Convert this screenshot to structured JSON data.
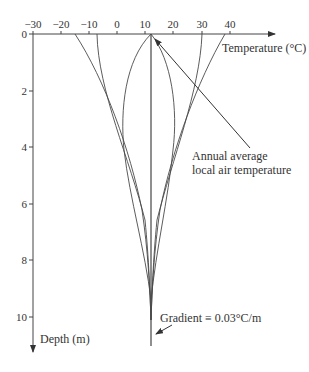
{
  "figure": {
    "x_axis": {
      "label": "Temperature (°C)",
      "ticks": [
        {
          "value": -30,
          "label": "−30",
          "x": 33
        },
        {
          "value": -20,
          "label": "−20",
          "x": 61
        },
        {
          "value": -10,
          "label": "−10",
          "x": 89
        },
        {
          "value": 0,
          "label": "0",
          "x": 117
        },
        {
          "value": 10,
          "label": "10",
          "x": 145
        },
        {
          "value": 20,
          "label": "20",
          "x": 173
        },
        {
          "value": 30,
          "label": "30",
          "x": 202
        },
        {
          "value": 40,
          "label": "40",
          "x": 230
        }
      ]
    },
    "y_axis": {
      "label": "Depth (m)",
      "ticks": [
        {
          "value": 0,
          "label": "0",
          "y": 34
        },
        {
          "value": 2,
          "label": "2",
          "y": 91
        },
        {
          "value": 4,
          "label": "4",
          "y": 147
        },
        {
          "value": 6,
          "label": "6",
          "y": 204
        },
        {
          "value": 8,
          "label": "8",
          "y": 260
        },
        {
          "value": 10,
          "label": "10",
          "y": 317
        }
      ]
    },
    "annotations": {
      "air_temp_line1": "Annual average",
      "air_temp_line2": "local air temperature",
      "gradient": "Gradient ≡ 0.03°C/m"
    },
    "colors": {
      "line": "#4a4a4a",
      "text": "#333333"
    }
  },
  "chart_data": {
    "type": "line",
    "title": "",
    "xlabel": "Temperature (°C)",
    "ylabel": "Depth (m)",
    "xlim": [
      -30,
      45
    ],
    "ylim": [
      0,
      11
    ],
    "y_inverted": true,
    "grid": false,
    "annotations": [
      {
        "text": "Annual average local air temperature",
        "points_to": {
          "temperature": 12,
          "depth": 0
        }
      },
      {
        "text": "Gradient ≡ 0.03°C/m",
        "points_to": {
          "temperature": 12,
          "depth": 10.5
        }
      }
    ],
    "series": [
      {
        "name": "Mean (annual average)",
        "points": [
          [
            12,
            0
          ],
          [
            12,
            11
          ]
        ]
      },
      {
        "name": "Winter extreme envelope",
        "points": [
          [
            -15,
            0
          ],
          [
            -5,
            2
          ],
          [
            4,
            4
          ],
          [
            9,
            6
          ],
          [
            11,
            8
          ],
          [
            12,
            10
          ]
        ]
      },
      {
        "name": "Cold transition",
        "points": [
          [
            -7,
            0
          ],
          [
            -3,
            2
          ],
          [
            5,
            4
          ],
          [
            10,
            6
          ],
          [
            11.5,
            8
          ],
          [
            12,
            10
          ]
        ]
      },
      {
        "name": "Spring curve",
        "points": [
          [
            12,
            0
          ],
          [
            4,
            1.5
          ],
          [
            3,
            3
          ],
          [
            7,
            5
          ],
          [
            10.5,
            7
          ],
          [
            12,
            9
          ]
        ]
      },
      {
        "name": "Autumn curve",
        "points": [
          [
            12,
            0
          ],
          [
            19,
            1.5
          ],
          [
            20,
            3
          ],
          [
            16,
            5
          ],
          [
            13,
            7
          ],
          [
            12,
            9
          ]
        ]
      },
      {
        "name": "Warm transition",
        "points": [
          [
            30,
            0
          ],
          [
            25,
            2
          ],
          [
            18,
            4
          ],
          [
            14,
            6
          ],
          [
            12.5,
            8
          ],
          [
            12,
            10
          ]
        ]
      },
      {
        "name": "Summer extreme envelope",
        "points": [
          [
            37,
            0
          ],
          [
            28,
            2
          ],
          [
            20,
            4
          ],
          [
            15,
            6
          ],
          [
            13,
            8
          ],
          [
            12,
            10
          ]
        ]
      }
    ]
  }
}
